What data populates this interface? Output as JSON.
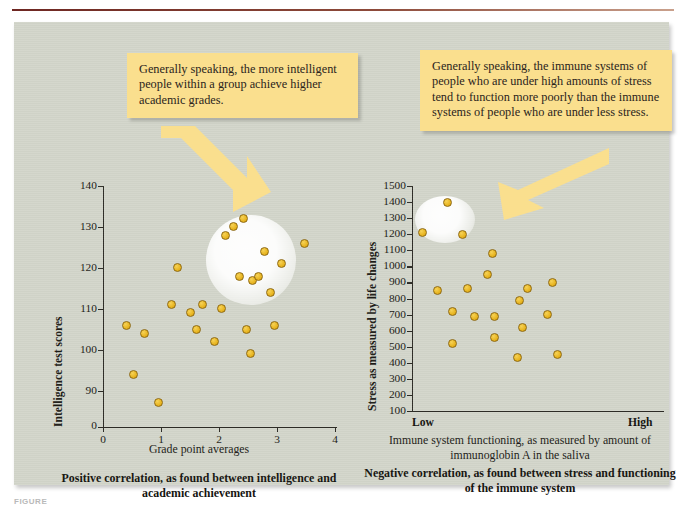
{
  "figure": {
    "label": "FIGURE",
    "accent_rule_color": "#6e2722",
    "panel_color": "#d3d6cb",
    "dot_color": "#e8b521",
    "callout_color": "#fadf8e"
  },
  "callouts": {
    "left": "Generally speaking, the more intelligent people within a group achieve higher academic grades.",
    "right": "Generally speaking, the immune systems of people who are under high amounts of stress tend to function more poorly than the immune systems of people who are under less stress."
  },
  "left_chart": {
    "caption": "Positive correlation, as found between intelligence and academic achievement"
  },
  "right_chart": {
    "axis_desc": "Immune system functioning, as measured by amount of immunoglobin A in the saliva",
    "caption": "Negative correlation, as found between stress and functioning of the immune system",
    "low_label": "Low",
    "high_label": "High"
  },
  "chart_data": [
    {
      "type": "scatter",
      "title": "Positive correlation, as found between intelligence and academic achievement",
      "xlabel": "Grade point averages",
      "ylabel": "Intelligence test scores",
      "xlim": [
        0,
        4
      ],
      "ylim": [
        85,
        140
      ],
      "xticks": [
        0,
        1,
        2,
        3,
        4
      ],
      "yticks": [
        90,
        100,
        110,
        120,
        130,
        140
      ],
      "y_axis_break_label": "0",
      "grid": false,
      "legend": "none",
      "points": [
        {
          "x": 0.4,
          "y": 106
        },
        {
          "x": 0.52,
          "y": 94
        },
        {
          "x": 0.72,
          "y": 104
        },
        {
          "x": 0.95,
          "y": 87
        },
        {
          "x": 1.18,
          "y": 111
        },
        {
          "x": 1.28,
          "y": 120
        },
        {
          "x": 1.5,
          "y": 109
        },
        {
          "x": 1.62,
          "y": 105
        },
        {
          "x": 1.72,
          "y": 111
        },
        {
          "x": 1.92,
          "y": 102
        },
        {
          "x": 2.05,
          "y": 110
        },
        {
          "x": 2.12,
          "y": 128
        },
        {
          "x": 2.25,
          "y": 130
        },
        {
          "x": 2.35,
          "y": 118
        },
        {
          "x": 2.42,
          "y": 132
        },
        {
          "x": 2.48,
          "y": 105
        },
        {
          "x": 2.55,
          "y": 99
        },
        {
          "x": 2.58,
          "y": 117
        },
        {
          "x": 2.68,
          "y": 118
        },
        {
          "x": 2.78,
          "y": 124
        },
        {
          "x": 2.88,
          "y": 114
        },
        {
          "x": 2.95,
          "y": 106
        },
        {
          "x": 3.08,
          "y": 121
        },
        {
          "x": 3.48,
          "y": 126
        }
      ],
      "highlight": {
        "cx": 2.55,
        "cy": 122,
        "r_x": 0.78,
        "r_y": 11
      }
    },
    {
      "type": "scatter",
      "title": "Negative correlation, as found between stress and functioning of the immune system",
      "xlabel": "Immune system functioning, as measured by amount of immunoglobin A in the saliva",
      "ylabel": "Stress as measured by life changes",
      "xlim": [
        0,
        100
      ],
      "ylim": [
        100,
        1500
      ],
      "xticks": [],
      "xtick_labels": [
        "Low",
        "High"
      ],
      "yticks": [
        100,
        200,
        300,
        400,
        500,
        600,
        700,
        800,
        900,
        1000,
        1100,
        1200,
        1300,
        1400,
        1500
      ],
      "grid": false,
      "legend": "none",
      "points": [
        {
          "x": 4,
          "y": 1210
        },
        {
          "x": 14,
          "y": 1400
        },
        {
          "x": 20,
          "y": 1200
        },
        {
          "x": 32,
          "y": 1080
        },
        {
          "x": 30,
          "y": 950
        },
        {
          "x": 22,
          "y": 860
        },
        {
          "x": 10,
          "y": 850
        },
        {
          "x": 16,
          "y": 720
        },
        {
          "x": 25,
          "y": 690
        },
        {
          "x": 33,
          "y": 690
        },
        {
          "x": 43,
          "y": 790
        },
        {
          "x": 46,
          "y": 860
        },
        {
          "x": 16,
          "y": 520
        },
        {
          "x": 33,
          "y": 560
        },
        {
          "x": 44,
          "y": 620
        },
        {
          "x": 54,
          "y": 700
        },
        {
          "x": 56,
          "y": 900
        },
        {
          "x": 42,
          "y": 430
        },
        {
          "x": 58,
          "y": 450
        }
      ],
      "highlight": {
        "cx": 13,
        "cy": 1290,
        "r_x": 12,
        "r_y": 145
      }
    }
  ]
}
